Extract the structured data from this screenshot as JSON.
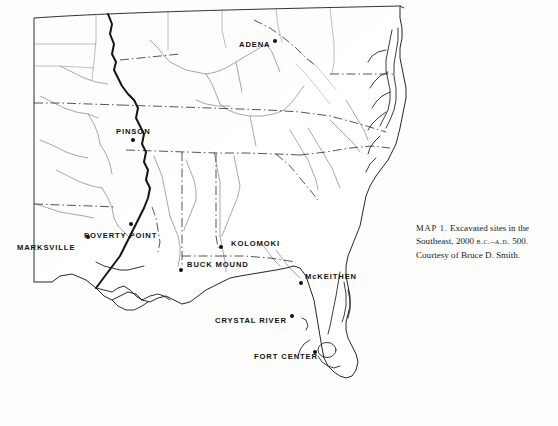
{
  "figure": {
    "kind": "reference-map",
    "region": "Southeastern United States",
    "caption": {
      "label": "MAP 1.",
      "line1_rest": " Excavated sites in the",
      "line2_a": "Southeast, 2000 ",
      "line2_bc": "b.c.",
      "line2_dash": "–",
      "line2_ad": "a.d.",
      "line2_b": " 500.",
      "line3": "Courtesy of Bruce D. Smith."
    }
  },
  "sites": [
    {
      "name": "ADENA",
      "label": "ADENA",
      "label_x": 239,
      "label_y": 41,
      "dot_x": 275,
      "dot_y": 41,
      "dot_side": "right"
    },
    {
      "name": "PINSON",
      "label": "PINSON",
      "label_x": 116,
      "label_y": 128,
      "dot_x": 133,
      "dot_y": 140,
      "dot_side": "below"
    },
    {
      "name": "POVERTY POINT",
      "label": "POVERTY POINT",
      "label_x": 84,
      "label_y": 232,
      "dot_x": 131,
      "dot_y": 224,
      "dot_side": "above-right"
    },
    {
      "name": "MARKSVILLE",
      "label": "MARKSVILLE",
      "label_x": 17,
      "label_y": 244,
      "dot_x": 88,
      "dot_y": 237,
      "dot_side": "right"
    },
    {
      "name": "KOLOMOKI",
      "label": "KOLOMOKI",
      "label_x": 231,
      "label_y": 240,
      "dot_x": 221,
      "dot_y": 247,
      "dot_side": "left"
    },
    {
      "name": "BUCK MOUND",
      "label": "BUCK MOUND",
      "label_x": 187,
      "label_y": 261,
      "dot_x": 181,
      "dot_y": 270,
      "dot_side": "below-left"
    },
    {
      "name": "McKEITHEN",
      "label": "McKEITHEN",
      "label_x": 305,
      "label_y": 273,
      "dot_x": 301,
      "dot_y": 283,
      "dot_side": "below-left"
    },
    {
      "name": "CRYSTAL RIVER",
      "label": "CRYSTAL RIVER",
      "label_x": 215,
      "label_y": 317,
      "dot_x": 292,
      "dot_y": 316,
      "dot_side": "right"
    },
    {
      "name": "FORT CENTER",
      "label": "FORT CENTER",
      "label_x": 254,
      "label_y": 353,
      "dot_x": 315,
      "dot_y": 352,
      "dot_side": "right"
    }
  ],
  "legend_note": {
    "map_border": "curved neatline frame",
    "river_style": "thin solid line",
    "state_boundary_style": "dash-dot line",
    "mississippi_style": "thick solid line"
  },
  "colors": {
    "page_background": "#fdfdfb",
    "ink": "#111111",
    "coastline": "#1a1a1a",
    "river": "#6d6d6d",
    "boundary": "#2a2a2a",
    "caption_text": "#1b1b1b"
  },
  "bleed_text": "·  ·    ·  ·      ·  ·    ·      ·  ·    ·  ·"
}
